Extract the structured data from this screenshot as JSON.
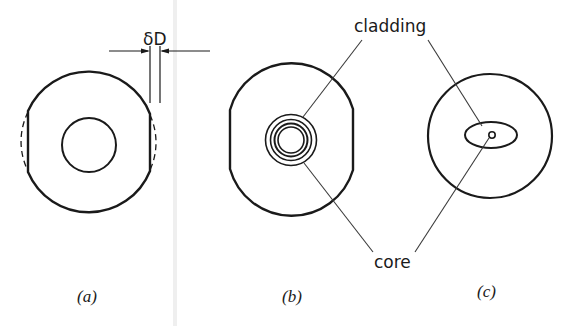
{
  "figure": {
    "labels": {
      "delta_d": "δD",
      "cladding": "cladding",
      "core": "core"
    },
    "panels": [
      {
        "id": "a",
        "caption": "(a)",
        "description": "Fiber with flattened sides; dashed arcs show removed material of width δD"
      },
      {
        "id": "b",
        "caption": "(b)",
        "description": "Flattened fiber with concentric cladding rings around core"
      },
      {
        "id": "c",
        "caption": "(c)",
        "description": "Round fiber with elliptical cladding and small core"
      }
    ],
    "colors": {
      "background": "#ffffff",
      "stroke": "#1a1a1a",
      "leader": "#3a3a3a",
      "crease": "#ececec"
    }
  }
}
